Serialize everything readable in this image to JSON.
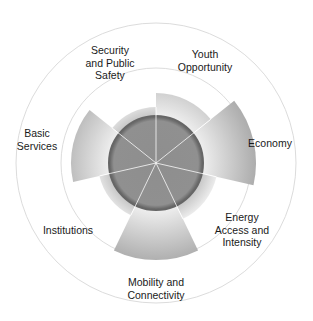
{
  "chart_data": {
    "type": "polar_bar",
    "title": "",
    "categories": [
      "Youth Opportunity",
      "Economy",
      "Energy Access and Intensity",
      "Mobility and Connectivity",
      "Institutions",
      "Basic Services",
      "Security and Public Safety"
    ],
    "values": [
      70,
      100,
      62,
      97,
      58,
      85,
      56
    ],
    "value_scale": "radius in px (relative; outer ring = 140, middle ring = 95, core disc = 47)",
    "start_angle_deg": 0,
    "direction": "clockwise",
    "rings": {
      "outer": 140,
      "middle": 95,
      "core": 47
    },
    "colors": {
      "wedge": "#a6a6a6",
      "wedge_light": "#e6e6e6",
      "core": "#8c8c8c",
      "core_rim": "#666666",
      "ring_stroke": "#d9d9d9",
      "spoke": "#ffffff"
    },
    "legend": null,
    "grid": false
  },
  "labels": [
    {
      "text_lines": [
        "Youth",
        "Opportunity"
      ],
      "x": 205,
      "y": 60
    },
    {
      "text_lines": [
        "Economy"
      ],
      "x": 270,
      "y": 143
    },
    {
      "text_lines": [
        "Energy",
        "Access and",
        "Intensity"
      ],
      "x": 242,
      "y": 230
    },
    {
      "text_lines": [
        "Mobility and",
        "Connectivity"
      ],
      "x": 156,
      "y": 288
    },
    {
      "text_lines": [
        "Institutions"
      ],
      "x": 68,
      "y": 230
    },
    {
      "text_lines": [
        "Basic",
        "Services"
      ],
      "x": 37,
      "y": 139
    },
    {
      "text_lines": [
        "Security",
        "and Public",
        "Safety"
      ],
      "x": 110,
      "y": 63
    }
  ]
}
